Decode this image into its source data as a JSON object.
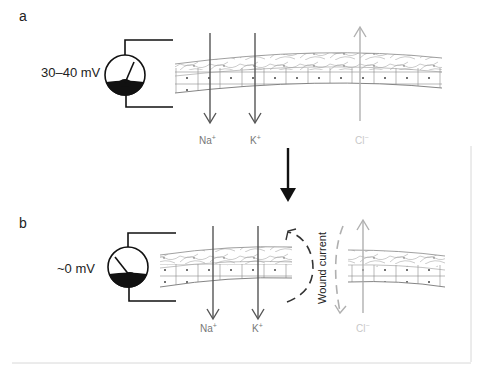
{
  "panels": [
    {
      "id": "a",
      "letter": "a",
      "voltage_label": "30–40 mV",
      "ions": [
        {
          "symbol": "Na",
          "charge": "+",
          "direction": "down"
        },
        {
          "symbol": "K",
          "charge": "+",
          "direction": "down"
        },
        {
          "symbol": "Cl",
          "charge": "−",
          "direction": "up"
        }
      ]
    },
    {
      "id": "b",
      "letter": "b",
      "voltage_label": "~0 mV",
      "annotation": "Wound current",
      "ions": [
        {
          "symbol": "Na",
          "charge": "+",
          "direction": "down"
        },
        {
          "symbol": "K",
          "charge": "+",
          "direction": "down"
        },
        {
          "symbol": "Cl",
          "charge": "−",
          "direction": "up"
        }
      ]
    }
  ],
  "transition_arrow": "down",
  "colors": {
    "line": "#111111",
    "ion_arrow": "#555555",
    "cl_arrow": "#b0b0b0",
    "tissue": "#777777",
    "frame": "#d8d8d8"
  }
}
